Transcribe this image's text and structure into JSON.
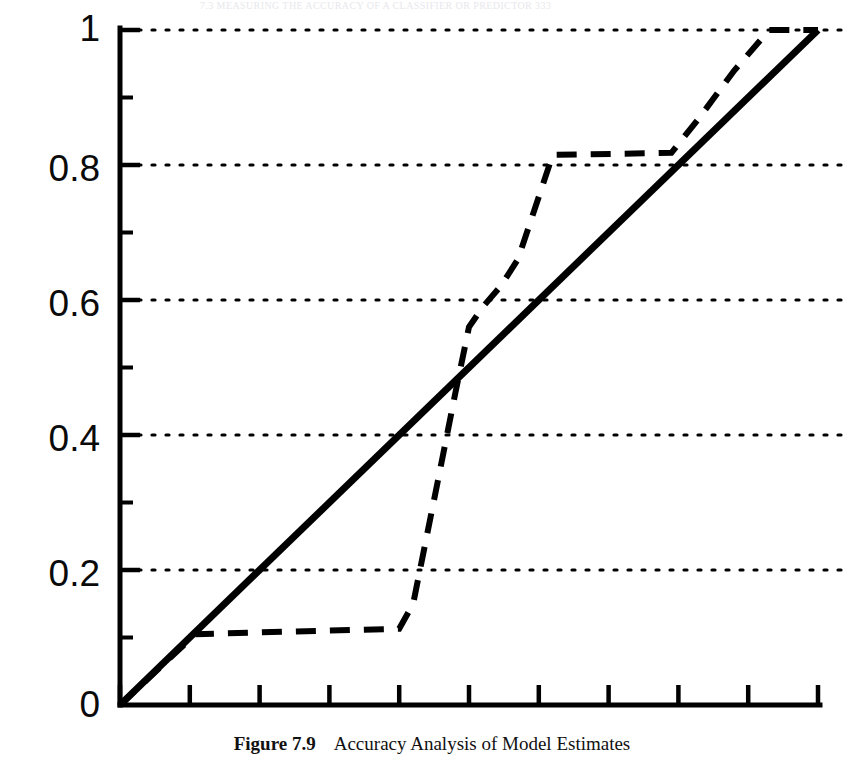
{
  "page": {
    "running_header": "7.3   MEASURING THE ACCURACY OF A CLASSIFIER OR PREDICTOR     333"
  },
  "caption": {
    "label": "Figure 7.9",
    "text": "Accuracy Analysis of Model Estimates"
  },
  "chart_data": {
    "type": "line",
    "title": "Accuracy Analysis of Model Estimates",
    "xlabel": "",
    "ylabel": "",
    "xlim": [
      0,
      1
    ],
    "ylim": [
      0,
      1
    ],
    "grid": "horizontal-dotted",
    "legend": "none",
    "y_tick_labels": [
      "0",
      "0.2",
      "0.4",
      "0.6",
      "0.8",
      "1"
    ],
    "y_ticks": [
      0,
      0.2,
      0.4,
      0.6,
      0.8,
      1
    ],
    "y_minor_ticks": [
      0.1,
      0.3,
      0.5,
      0.7,
      0.9
    ],
    "x_ticks": [
      0,
      0.1,
      0.2,
      0.3,
      0.4,
      0.5,
      0.6,
      0.7,
      0.8,
      0.9,
      1
    ],
    "x_tick_labels": [
      "",
      "",
      "",
      "",
      "",
      "",
      "",
      "",
      "",
      "",
      ""
    ],
    "gridlines_y": [
      0.2,
      0.4,
      0.6,
      0.8,
      1.0
    ],
    "series": [
      {
        "name": "baseline",
        "style": "solid",
        "width": 7,
        "color": "#000000",
        "x": [
          0,
          1
        ],
        "y": [
          0,
          1
        ]
      },
      {
        "name": "model-estimate",
        "style": "dashed",
        "width": 6,
        "color": "#000000",
        "x": [
          0.0,
          0.108,
          0.4,
          0.42,
          0.455,
          0.48,
          0.5,
          0.52,
          0.545,
          0.57,
          0.62,
          0.79,
          0.83,
          0.88,
          0.93,
          1.0
        ],
        "y": [
          0.0,
          0.105,
          0.113,
          0.15,
          0.33,
          0.46,
          0.56,
          0.59,
          0.62,
          0.66,
          0.815,
          0.818,
          0.87,
          0.94,
          1.0,
          1.0
        ]
      }
    ]
  },
  "axes_geometry": {
    "left_px": 120,
    "right_px": 818,
    "top_px": 30,
    "bottom_px": 705
  }
}
